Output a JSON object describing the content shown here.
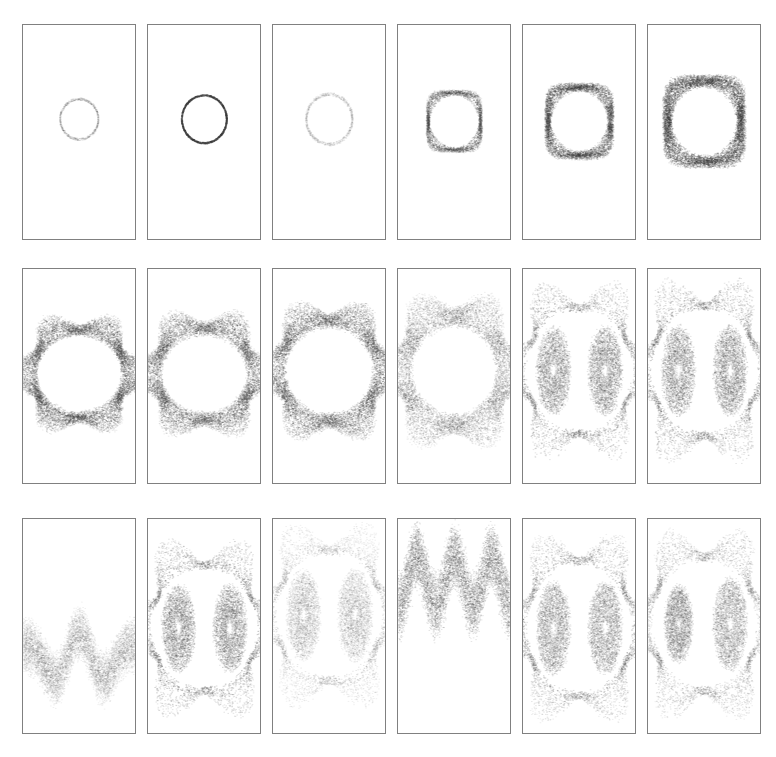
{
  "figure": {
    "title": "",
    "background_color": "#ffffff",
    "width": 776,
    "height": 757,
    "panel_border_color": "#808080",
    "point_color": "#3a3a3a",
    "grid": {
      "rows": 3,
      "cols": 6
    },
    "panel_geometry": {
      "col_x": [
        22,
        147,
        272,
        397,
        522,
        647
      ],
      "row_y": [
        24,
        268,
        518
      ],
      "panel_width": 114,
      "panel_height": 216
    }
  },
  "chart_data": {
    "type": "scatter",
    "title": "",
    "subtitle": "",
    "xlabel": "",
    "ylabel": "",
    "xlim": [
      -1,
      1
    ],
    "ylim": [
      -1,
      1
    ],
    "grid": false,
    "legend": null,
    "panels": [
      {
        "row": 0,
        "col": 0,
        "index": 1,
        "shape": "circle",
        "density": 0.18,
        "center": [
          0.0,
          0.12
        ],
        "radius_x": 0.34,
        "radius_y": 0.19,
        "lobes": 0,
        "bands": 1,
        "band_spread": 0.01,
        "noise": 0.012,
        "points": 900
      },
      {
        "row": 0,
        "col": 1,
        "index": 2,
        "shape": "circle",
        "density": 0.95,
        "center": [
          0.0,
          0.12
        ],
        "radius_x": 0.4,
        "radius_y": 0.225,
        "lobes": 0,
        "bands": 1,
        "band_spread": 0.008,
        "noise": 0.008,
        "points": 1400
      },
      {
        "row": 0,
        "col": 2,
        "index": 3,
        "shape": "circle",
        "density": 0.16,
        "center": [
          0.0,
          0.12
        ],
        "radius_x": 0.41,
        "radius_y": 0.235,
        "lobes": 0,
        "bands": 1,
        "band_spread": 0.012,
        "noise": 0.016,
        "points": 900
      },
      {
        "row": 0,
        "col": 3,
        "index": 4,
        "shape": "rounded-square",
        "density": 0.62,
        "center": [
          0.0,
          0.1
        ],
        "radius_x": 0.47,
        "radius_y": 0.27,
        "lobes": 4,
        "bands": 5,
        "band_spread": 0.035,
        "noise": 0.018,
        "points": 3200
      },
      {
        "row": 0,
        "col": 4,
        "index": 5,
        "shape": "rounded-square",
        "density": 0.72,
        "center": [
          0.0,
          0.1
        ],
        "radius_x": 0.56,
        "radius_y": 0.32,
        "lobes": 4,
        "bands": 9,
        "band_spread": 0.065,
        "noise": 0.024,
        "points": 5200
      },
      {
        "row": 0,
        "col": 5,
        "index": 6,
        "shape": "rounded-square",
        "density": 0.8,
        "center": [
          0.0,
          0.1
        ],
        "radius_x": 0.66,
        "radius_y": 0.38,
        "lobes": 4,
        "bands": 13,
        "band_spread": 0.09,
        "noise": 0.03,
        "points": 7000
      },
      {
        "row": 1,
        "col": 0,
        "index": 7,
        "shape": "hexagon",
        "density": 0.7,
        "center": [
          0.0,
          0.02
        ],
        "radius_x": 0.92,
        "radius_y": 0.45,
        "lobes": 6,
        "bands": 16,
        "band_spread": 0.16,
        "noise": 0.03,
        "points": 8200
      },
      {
        "row": 1,
        "col": 1,
        "index": 8,
        "shape": "hexagon",
        "density": 0.62,
        "center": [
          0.0,
          0.02
        ],
        "radius_x": 0.95,
        "radius_y": 0.47,
        "lobes": 6,
        "bands": 18,
        "band_spread": 0.18,
        "noise": 0.034,
        "points": 8600
      },
      {
        "row": 1,
        "col": 2,
        "index": 9,
        "shape": "hexagon",
        "density": 0.66,
        "center": [
          0.0,
          0.05
        ],
        "radius_x": 0.97,
        "radius_y": 0.52,
        "lobes": 6,
        "bands": 18,
        "band_spread": 0.18,
        "noise": 0.034,
        "points": 8800
      },
      {
        "row": 1,
        "col": 3,
        "index": 10,
        "shape": "hexagon",
        "density": 0.45,
        "center": [
          0.0,
          0.05
        ],
        "radius_x": 0.99,
        "radius_y": 0.56,
        "lobes": 6,
        "bands": 20,
        "band_spread": 0.22,
        "noise": 0.036,
        "points": 8600
      },
      {
        "row": 1,
        "col": 4,
        "index": 11,
        "shape": "twin-lobe",
        "density": 0.6,
        "center": [
          0.0,
          0.05
        ],
        "radius_x": 1.0,
        "radius_y": 0.58,
        "lobes": 6,
        "bands": 22,
        "band_spread": 0.26,
        "noise": 0.036,
        "points": 9400
      },
      {
        "row": 1,
        "col": 5,
        "index": 12,
        "shape": "twin-lobe",
        "density": 0.58,
        "center": [
          0.0,
          0.05
        ],
        "radius_x": 1.0,
        "radius_y": 0.6,
        "lobes": 6,
        "bands": 24,
        "band_spread": 0.3,
        "noise": 0.036,
        "points": 9600
      },
      {
        "row": 2,
        "col": 0,
        "index": 13,
        "shape": "wave-band",
        "density": 0.3,
        "center": [
          0.0,
          -0.3
        ],
        "radius_x": 1.0,
        "radius_y": 0.4,
        "lobes": 2,
        "bands": 18,
        "band_spread": 0.28,
        "noise": 0.03,
        "points": 7000
      },
      {
        "row": 2,
        "col": 1,
        "index": 14,
        "shape": "twin-lobe",
        "density": 0.62,
        "center": [
          0.0,
          -0.02
        ],
        "radius_x": 1.0,
        "radius_y": 0.58,
        "lobes": 2,
        "bands": 24,
        "band_spread": 0.32,
        "noise": 0.034,
        "points": 9600
      },
      {
        "row": 2,
        "col": 2,
        "index": 15,
        "shape": "twin-lobe-faint",
        "density": 0.32,
        "center": [
          0.0,
          0.1
        ],
        "radius_x": 1.0,
        "radius_y": 0.6,
        "lobes": 2,
        "bands": 24,
        "band_spread": 0.36,
        "noise": 0.04,
        "points": 9000
      },
      {
        "row": 2,
        "col": 3,
        "index": 16,
        "shape": "wave-band",
        "density": 0.55,
        "center": [
          0.0,
          0.42
        ],
        "radius_x": 1.0,
        "radius_y": 0.3,
        "lobes": 3,
        "bands": 20,
        "band_spread": 0.34,
        "noise": 0.04,
        "points": 8000
      },
      {
        "row": 2,
        "col": 4,
        "index": 17,
        "shape": "twin-lobe",
        "density": 0.55,
        "center": [
          0.0,
          -0.02
        ],
        "radius_x": 1.0,
        "radius_y": 0.62,
        "lobes": 2,
        "bands": 26,
        "band_spread": 0.38,
        "noise": 0.036,
        "points": 9800
      },
      {
        "row": 2,
        "col": 5,
        "index": 18,
        "shape": "twin-lobe-asym",
        "density": 0.5,
        "center": [
          0.0,
          0.02
        ],
        "radius_x": 1.0,
        "radius_y": 0.62,
        "lobes": 2,
        "bands": 26,
        "band_spread": 0.4,
        "noise": 0.04,
        "points": 9800
      }
    ]
  }
}
